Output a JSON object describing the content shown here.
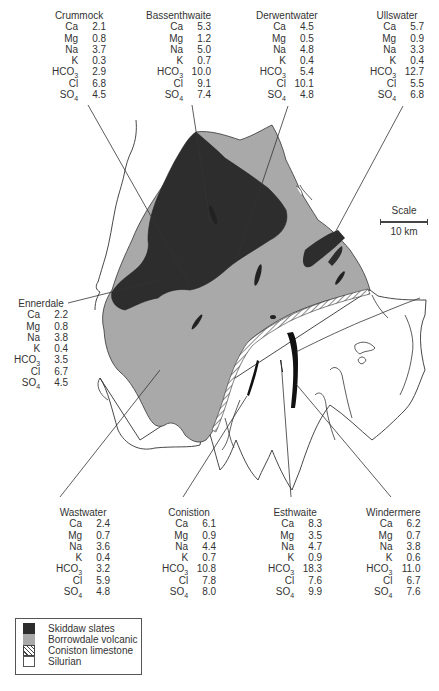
{
  "map": {
    "units_label": "",
    "scale": {
      "title": "Scale",
      "distance": "10 km"
    },
    "colors": {
      "skiddaw_slates": "#2d2d2d",
      "borrowdale_volcanic": "#a9a9a9",
      "coniston_limestone": "#e8e8e8",
      "silurian": "#ffffff",
      "outline": "#333333"
    }
  },
  "ion_labels": {
    "ca": "Ca",
    "mg": "Mg",
    "na": "Na",
    "k": "K",
    "hco3_base": "HCO",
    "hco3_sub": "3",
    "cl": "Cl",
    "so4_base": "SO",
    "so4_sub": "4"
  },
  "stations": {
    "crummock": {
      "name": "Crummock",
      "ca": "2.1",
      "mg": "0.8",
      "na": "3.7",
      "k": "0.3",
      "hco3": "2.9",
      "cl": "6.8",
      "so4": "4.5"
    },
    "bassenthwaite": {
      "name": "Bassenthwaite",
      "ca": "5.3",
      "mg": "1.2",
      "na": "5.0",
      "k": "0.7",
      "hco3": "10.0",
      "cl": "9.1",
      "so4": "7.4"
    },
    "derwentwater": {
      "name": "Derwentwater",
      "ca": "4.5",
      "mg": "0.5",
      "na": "4.8",
      "k": "0.4",
      "hco3": "5.4",
      "cl": "10.1",
      "so4": "4.8"
    },
    "ullswater": {
      "name": "Ullswater",
      "ca": "5.7",
      "mg": "0.9",
      "na": "3.3",
      "k": "0.4",
      "hco3": "12.7",
      "cl": "5.5",
      "so4": "6.8"
    },
    "ennerdale": {
      "name": "Ennerdale",
      "ca": "2.2",
      "mg": "0.8",
      "na": "3.8",
      "k": "0.4",
      "hco3": "3.5",
      "cl": "6.7",
      "so4": "4.5"
    },
    "wastwater": {
      "name": "Wastwater",
      "ca": "2.4",
      "mg": "0.7",
      "na": "3.6",
      "k": "0.4",
      "hco3": "3.2",
      "cl": "5.9",
      "so4": "4.8"
    },
    "conistion": {
      "name": "Conistion",
      "ca": "6.1",
      "mg": "0.9",
      "na": "4.4",
      "k": "0.7",
      "hco3": "10.8",
      "cl": "7.8",
      "so4": "8.0"
    },
    "esthwaite": {
      "name": "Esthwaite",
      "ca": "8.3",
      "mg": "3.5",
      "na": "4.7",
      "k": "0.9",
      "hco3": "18.3",
      "cl": "7.6",
      "so4": "9.9"
    },
    "windermere": {
      "name": "Windermere",
      "ca": "6.2",
      "mg": "0.7",
      "na": "3.8",
      "k": "0.6",
      "hco3": "11.0",
      "cl": "6.7",
      "so4": "7.6"
    }
  },
  "legend": {
    "items": [
      {
        "label": "Skiddaw slates",
        "icon": "dark-fill-swatch"
      },
      {
        "label": "Borrowdale volcanic",
        "icon": "grey-fill-swatch"
      },
      {
        "label": "Coniston limestone",
        "icon": "hatched-swatch"
      },
      {
        "label": "Silurian",
        "icon": "white-swatch"
      }
    ]
  }
}
